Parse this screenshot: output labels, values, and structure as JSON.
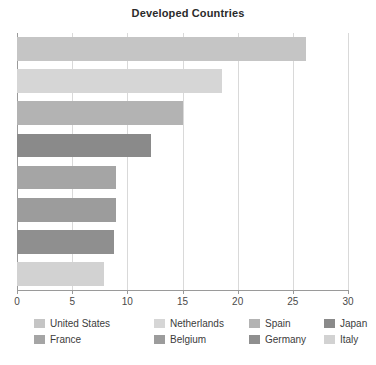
{
  "chart_data": {
    "type": "bar",
    "orientation": "horizontal",
    "title": "Developed Countries",
    "xlabel": "",
    "ylabel": "",
    "xlim": [
      0,
      30
    ],
    "grid": true,
    "legend_position": "bottom",
    "xticks": [
      0,
      5,
      10,
      15,
      20,
      25,
      30
    ],
    "xtick_labels": [
      "0",
      "5",
      "10",
      "15",
      "20",
      "25",
      "30"
    ],
    "categories": [
      "United States",
      "Netherlands",
      "Spain",
      "Japan",
      "France",
      "Belgium",
      "Germany",
      "Italy"
    ],
    "values": [
      26.2,
      18.6,
      15.0,
      12.1,
      9.0,
      9.0,
      8.8,
      7.9
    ],
    "colors": [
      "#c5c5c5",
      "#d6d6d6",
      "#b3b3b3",
      "#8a8a8a",
      "#a5a5a5",
      "#9c9c9c",
      "#8f8f8f",
      "#d2d2d2"
    ]
  },
  "legend": {
    "rows": [
      [
        {
          "label": "United States",
          "color": "#c5c5c5"
        },
        {
          "label": "Netherlands",
          "color": "#d6d6d6"
        },
        {
          "label": "Spain",
          "color": "#b3b3b3"
        },
        {
          "label": "Japan",
          "color": "#8a8a8a"
        }
      ],
      [
        {
          "label": "France",
          "color": "#a5a5a5"
        },
        {
          "label": "Belgium",
          "color": "#9c9c9c"
        },
        {
          "label": "Germany",
          "color": "#8f8f8f"
        },
        {
          "label": "Italy",
          "color": "#d2d2d2"
        }
      ]
    ],
    "column_offsets": [
      0,
      120,
      215,
      290
    ]
  },
  "style": {
    "grid_color": "#d9d9d9",
    "axis_color": "#9a9a9a",
    "title_color": "#2b2b2b",
    "tick_label_color": "#4a4a4a",
    "background": "#ffffff"
  }
}
